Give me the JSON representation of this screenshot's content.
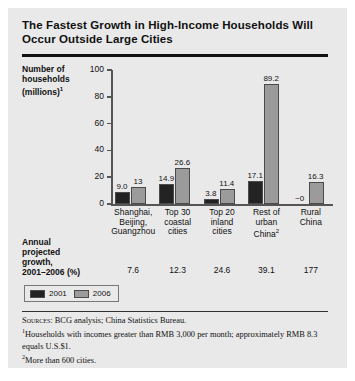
{
  "title": "The Fastest Growth in High-Income Households Will Occur Outside Large Cities",
  "axis": {
    "ylabel_line1": "Number of",
    "ylabel_line2": "households",
    "ylabel_line3": "(millions)",
    "ylabel_superscript": "1"
  },
  "growth": {
    "label_line1": "Annual",
    "label_line2": "projected",
    "label_line3": "growth,",
    "label_line4": "2001–2006 (%)"
  },
  "legend": {
    "items": [
      {
        "label": "2001",
        "color": "#232323"
      },
      {
        "label": "2006",
        "color": "#9b9b9b"
      }
    ]
  },
  "notes": {
    "sources_prefix": "Sources:",
    "sources_text": " BCG analysis; China Statistics Bureau.",
    "note1_marker": "1",
    "note1_text": "Households with incomes greater than RMB 3,000 per month; approximately RMB 8.3 equals U.S.$1.",
    "note2_marker": "2",
    "note2_text": "More than 600 cities."
  },
  "chart_data": {
    "type": "bar",
    "title": "The Fastest Growth in High-Income Households Will Occur Outside Large Cities",
    "xlabel": "",
    "ylabel": "Number of households (millions)",
    "ylim": [
      0,
      100
    ],
    "yticks": [
      0,
      20,
      40,
      60,
      80,
      100
    ],
    "grid": false,
    "legend_position": "below-left",
    "categories": [
      "Shanghai, Beijing, Guangzhou",
      "Top 30 coastal cities",
      "Top 20 inland cities",
      "Rest of urban China",
      "Rural China"
    ],
    "category_lines": [
      [
        "Shanghai,",
        "Beijing,",
        "Guangzhou"
      ],
      [
        "Top 30",
        "coastal",
        "cities"
      ],
      [
        "Top 20",
        "inland",
        "cities"
      ],
      [
        "Rest of",
        "urban",
        "China"
      ],
      [
        "Rural",
        "China"
      ]
    ],
    "category_superscripts": [
      "",
      "",
      "",
      "2",
      ""
    ],
    "series": [
      {
        "name": "2001",
        "color": "#232323",
        "values": [
          9.0,
          14.9,
          3.8,
          17.1,
          0
        ],
        "labels": [
          "9.0",
          "14.9",
          "3.8",
          "17.1",
          "~0"
        ]
      },
      {
        "name": "2006",
        "color": "#9b9b9b",
        "values": [
          13,
          26.6,
          11.4,
          89.2,
          16.3
        ],
        "labels": [
          "13",
          "26.6",
          "11.4",
          "89.2",
          "16.3"
        ]
      }
    ],
    "annual_projected_growth_pct": [
      "7.6",
      "12.3",
      "24.6",
      "39.1",
      "177"
    ],
    "annual_projected_growth_label": "Annual projected growth, 2001–2006 (%)"
  }
}
